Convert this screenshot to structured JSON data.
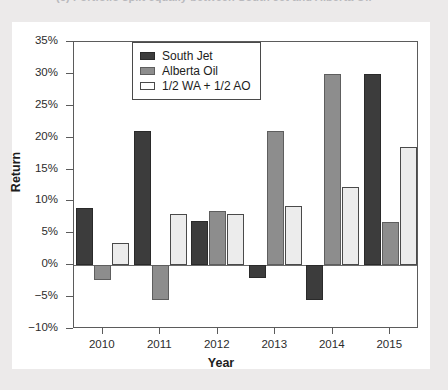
{
  "caption": {
    "text": "(c) Portfolio split equally between South Jet and Alberta Oil"
  },
  "chart_data": {
    "type": "bar",
    "title": "",
    "xlabel": "Year",
    "ylabel": "Return",
    "categories": [
      "2010",
      "2011",
      "2012",
      "2013",
      "2014",
      "2015"
    ],
    "series": [
      {
        "name": "South Jet",
        "values": [
          9.0,
          21.0,
          7.0,
          -2.0,
          -5.5,
          30.0
        ]
      },
      {
        "name": "Alberta Oil",
        "values": [
          -2.3,
          -5.5,
          8.5,
          21.0,
          30.0,
          6.8
        ]
      },
      {
        "name": "1/2 WA + 1/2 AO",
        "values": [
          3.5,
          8.0,
          8.0,
          9.3,
          12.2,
          18.5
        ]
      }
    ],
    "ylim": [
      -10,
      35
    ],
    "ytick_values": [
      -10,
      -5,
      0,
      5,
      10,
      15,
      20,
      25,
      30,
      35
    ],
    "ytick_labels": [
      "−10%",
      "−5%",
      "0%",
      "5%",
      "10%",
      "15%",
      "20%",
      "25%",
      "30%",
      "35%"
    ],
    "grid": false,
    "legend_position": "top-center",
    "legend_entries": [
      "South Jet",
      "Alberta Oil",
      "1/2 WA + 1/2 AO"
    ],
    "colors": {
      "south_jet": "#3c3c3c",
      "alberta_oil": "#8d8d8d",
      "blend": "#ececec",
      "axis": "#5b5b5b",
      "background": "#ffffff",
      "page_background": "#eceaea"
    }
  }
}
